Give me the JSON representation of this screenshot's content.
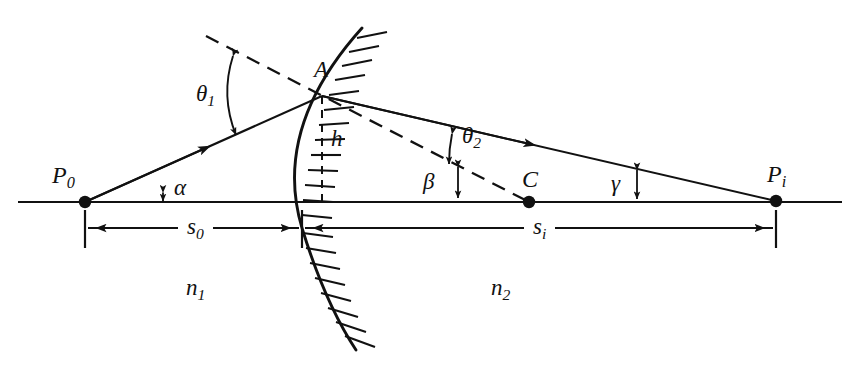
{
  "figure": {
    "background_color": "#ffffff",
    "stroke_color": "#111111",
    "width": 860,
    "height": 374
  },
  "labels": {
    "point_object": {
      "base": "P",
      "sub": "0"
    },
    "point_image": {
      "base": "P",
      "sub": "i"
    },
    "point_center": {
      "base": "C",
      "sub": ""
    },
    "point_surface": {
      "base": "A",
      "sub": ""
    },
    "height": {
      "base": "h",
      "sub": ""
    },
    "angle_alpha": {
      "base": "α",
      "sub": ""
    },
    "angle_beta": {
      "base": "β",
      "sub": ""
    },
    "angle_gamma": {
      "base": "γ",
      "sub": ""
    },
    "angle_theta1": {
      "base": "θ",
      "sub": "1"
    },
    "angle_theta2": {
      "base": "θ",
      "sub": "2"
    },
    "index_n1": {
      "base": "n",
      "sub": "1"
    },
    "index_n2": {
      "base": "n",
      "sub": "2"
    },
    "distance_s0": {
      "base": "s",
      "sub": "0"
    },
    "distance_si": {
      "base": "s",
      "sub": "i"
    }
  },
  "geometry": {
    "axis": {
      "x1": 18,
      "y": 202,
      "x2": 842
    },
    "object_point": {
      "x": 85,
      "y": 202
    },
    "image_point": {
      "x": 776,
      "y": 201
    },
    "center_point": {
      "x": 529,
      "y": 202
    },
    "surface_point_A": {
      "x": 322,
      "y": 96
    },
    "vertex": {
      "x": 302,
      "y": 228
    },
    "surface_arc": {
      "top_x": 362,
      "top_y": 28,
      "bottom_x": 356,
      "bottom_y": 350
    },
    "normal_dash_start": {
      "x": 206,
      "y": 36
    },
    "normal_dash_end": {
      "x": 560,
      "y": 176
    },
    "dim_line_y": 228,
    "s0_span": {
      "x1": 85,
      "x2": 302
    },
    "si_span": {
      "x1": 302,
      "x2": 776
    }
  }
}
